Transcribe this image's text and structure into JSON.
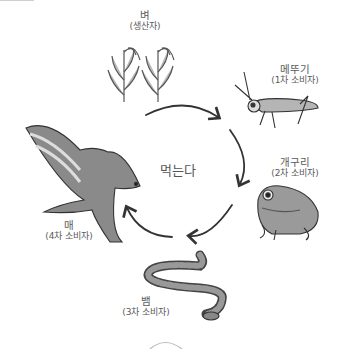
{
  "diagram": {
    "center_label": "먹는다",
    "nodes": [
      {
        "id": "rice",
        "name": "벼",
        "role": "(생산자)",
        "icon": "rice-plant-icon"
      },
      {
        "id": "grasshopper",
        "name": "메뚜기",
        "role": "(1차 소비자)",
        "icon": "grasshopper-icon"
      },
      {
        "id": "frog",
        "name": "개구리",
        "role": "(2차 소비자)",
        "icon": "frog-icon"
      },
      {
        "id": "snake",
        "name": "뱀",
        "role": "(3차 소비자)",
        "icon": "snake-icon"
      },
      {
        "id": "hawk",
        "name": "매",
        "role": "(4차 소비자)",
        "icon": "hawk-icon"
      }
    ],
    "edges": [
      {
        "from": "rice",
        "to": "grasshopper"
      },
      {
        "from": "grasshopper",
        "to": "frog"
      },
      {
        "from": "frog",
        "to": "snake"
      },
      {
        "from": "snake",
        "to": "hawk"
      }
    ],
    "colors": {
      "line": "#333333",
      "fill": "#8a8a8a",
      "light": "#d8d8d8",
      "text": "#5a5a5a"
    }
  }
}
